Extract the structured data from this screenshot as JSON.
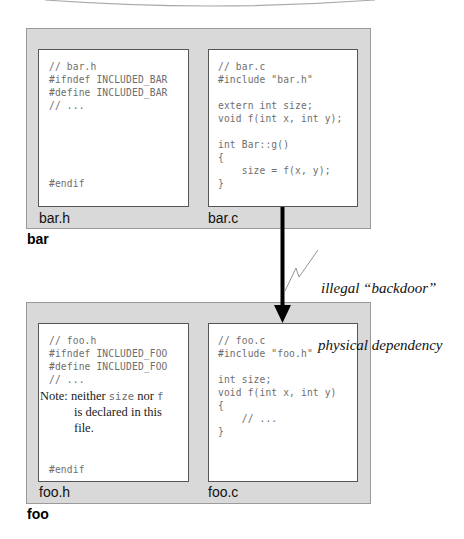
{
  "packages": [
    {
      "name": "bar",
      "components": [
        {
          "label": "bar.h",
          "code": "// bar.h\n#ifndef INCLUDED_BAR\n#define INCLUDED_BAR\n// ...\n\n\n\n\n\n#endif"
        },
        {
          "label": "bar.c",
          "code": "// bar.c\n#include \"bar.h\"\n\nextern int size;\nvoid f(int x, int y);\n\nint Bar::g()\n{\n    size = f(x, y);\n}"
        }
      ]
    },
    {
      "name": "foo",
      "components": [
        {
          "label": "foo.h",
          "code_top": "// foo.h\n#ifndef INCLUDED_FOO\n#define INCLUDED_FOO\n// ...",
          "note": {
            "prefix": "Note:",
            "text_1": "neither",
            "code_1": "size",
            "text_2": "nor",
            "code_2": "f",
            "line_2": "is declared in this",
            "line_3": "file."
          },
          "code_bottom": "#endif"
        },
        {
          "label": "foo.c",
          "code": "// foo.c\n#include \"foo.h\"\n\nint size;\nvoid f(int x, int y)\n{\n    // ...\n}"
        }
      ]
    }
  ],
  "dependency": {
    "from": "bar.c",
    "to": "foo.c",
    "annotation_line_1": "illegal “backdoor”",
    "annotation_line_2": "physical dependency",
    "color": "#000000"
  },
  "colors": {
    "package_fill": "#d9d9d9",
    "component_fill": "#ffffff",
    "code_text": "#6e6e6e"
  }
}
